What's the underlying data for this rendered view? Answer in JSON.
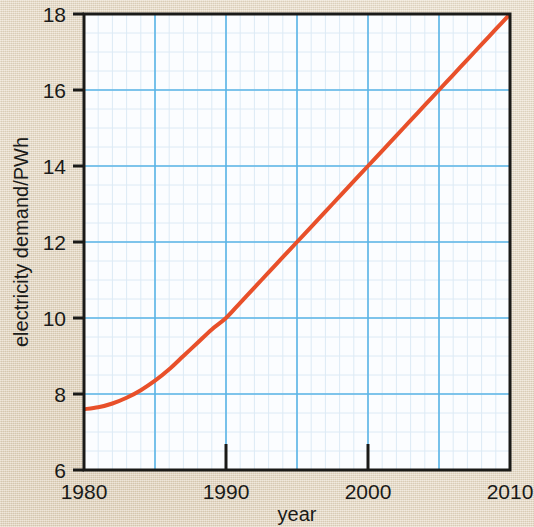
{
  "figure": {
    "background_color": "#e7dbc7",
    "plot_background_color": "#fbfdff",
    "axis_color": "#1a1a18",
    "major_grid_color": "#5ab4e6",
    "minor_grid_color": "#dceaf5",
    "curve_color": "#e8502a"
  },
  "chart_data": {
    "type": "line",
    "title": "",
    "xlabel": "year",
    "ylabel": "electricity demand/PWh",
    "xlim": [
      1980,
      2010
    ],
    "ylim": [
      6,
      18
    ],
    "xticks": [
      1980,
      1990,
      2000,
      2010
    ],
    "xtick_labels": [
      "1980",
      "1990",
      "2000",
      "2010"
    ],
    "yticks": [
      6,
      8,
      10,
      12,
      14,
      16,
      18
    ],
    "ytick_labels": [
      "6",
      "8",
      "10",
      "12",
      "14",
      "16",
      "18"
    ],
    "x_major_grid": [
      1980,
      1985,
      1990,
      1995,
      2000,
      2005,
      2010
    ],
    "y_major_grid": [
      6,
      8,
      10,
      12,
      14,
      16,
      18
    ],
    "x_minor_step": 1,
    "y_minor_step": 0.5,
    "grid": true,
    "legend": null,
    "series": [
      {
        "name": "electricity demand",
        "color": "#e8502a",
        "line_width": 4,
        "x": [
          1980,
          1981,
          1982,
          1983,
          1984,
          1985,
          1986,
          1987,
          1988,
          1989,
          1990,
          1991,
          1992,
          1993,
          1994,
          1995,
          1996,
          1997,
          1998,
          1999,
          2000,
          2001,
          2002,
          2003,
          2004,
          2005,
          2006,
          2007,
          2008,
          2009,
          2010
        ],
        "values": [
          7.6,
          7.65,
          7.75,
          7.9,
          8.1,
          8.35,
          8.65,
          9.0,
          9.35,
          9.7,
          10.0,
          10.4,
          10.8,
          11.2,
          11.6,
          12.0,
          12.4,
          12.8,
          13.2,
          13.6,
          14.0,
          14.4,
          14.8,
          15.2,
          15.6,
          16.0,
          16.4,
          16.8,
          17.2,
          17.6,
          18.0
        ]
      }
    ],
    "annotations": []
  },
  "axes": {
    "y_axis_title": "electricity demand/PWh",
    "x_axis_title": "year"
  }
}
